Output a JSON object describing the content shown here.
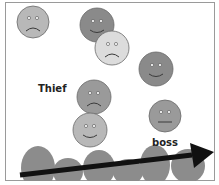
{
  "diagram": {
    "labels": {
      "thief": "Thief",
      "boss": "boss"
    },
    "faces": [
      {
        "id": "face-1",
        "expression": "sad",
        "shade": "light",
        "color": "#b8b8b8",
        "cx": 33,
        "cy": 22,
        "r": 16
      },
      {
        "id": "face-2",
        "expression": "smile",
        "shade": "dark",
        "color": "#8a8a8a",
        "cx": 97,
        "cy": 25,
        "r": 17
      },
      {
        "id": "face-3",
        "expression": "sad",
        "shade": "very-light",
        "color": "#dcdcdc",
        "cx": 112,
        "cy": 48,
        "r": 17
      },
      {
        "id": "face-4",
        "expression": "smile",
        "shade": "dark",
        "color": "#8a8a8a",
        "cx": 156,
        "cy": 69,
        "r": 17
      },
      {
        "id": "face-5",
        "expression": "sad",
        "shade": "medium",
        "color": "#9a9a9a",
        "cx": 94,
        "cy": 97,
        "r": 17
      },
      {
        "id": "face-6",
        "expression": "smile",
        "shade": "light",
        "color": "#b8b8b8",
        "cx": 90,
        "cy": 130,
        "r": 17
      },
      {
        "id": "face-7",
        "expression": "neutral",
        "shade": "medium",
        "color": "#9a9a9a",
        "cx": 165,
        "cy": 116,
        "r": 16
      }
    ],
    "colors": {
      "wave": "#8c8c8c",
      "arrow": "#111111",
      "border": "#9a9a9a",
      "outline": "#6a6a6a"
    }
  }
}
